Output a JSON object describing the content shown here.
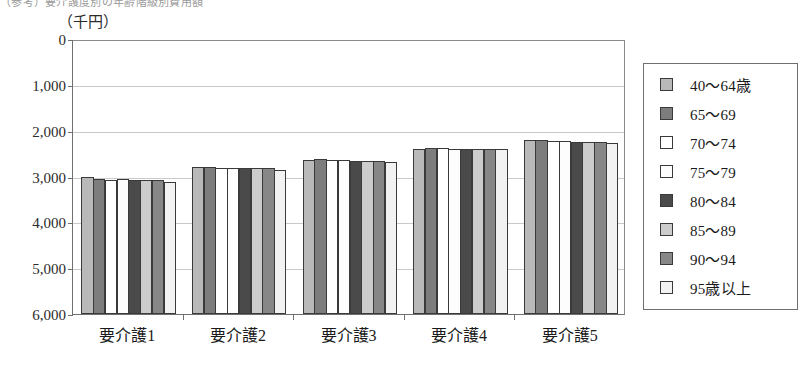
{
  "page": {
    "cut_title": "（参考）要介護度別の年齢階級別費用額"
  },
  "chart": {
    "unit_label": "（千円）",
    "y_ticks": [
      "6,000",
      "5,000",
      "4,000",
      "3,000",
      "2,000",
      "1,000",
      "0"
    ],
    "x_labels": [
      "要介護1",
      "要介護2",
      "要介護3",
      "要介護4",
      "要介護5"
    ],
    "legend_title": ""
  },
  "legend": {
    "items": [
      {
        "label": "40〜64歳",
        "swatch": "legend-swatch-0",
        "color": "#b9b9b9"
      },
      {
        "label": "65〜69",
        "swatch": "legend-swatch-1",
        "color": "#7d7d7d"
      },
      {
        "label": "70〜74",
        "swatch": "legend-swatch-2",
        "color": "#ffffff"
      },
      {
        "label": "75〜79",
        "swatch": "legend-swatch-3",
        "color": "#fdfdfd"
      },
      {
        "label": "80〜84",
        "swatch": "legend-swatch-4",
        "color": "#4a4a4a"
      },
      {
        "label": "85〜89",
        "swatch": "legend-swatch-5",
        "color": "#cccccc"
      },
      {
        "label": "90〜94",
        "swatch": "legend-swatch-6",
        "color": "#878787"
      },
      {
        "label": "95歳以上",
        "swatch": "legend-swatch-7",
        "color": "#f2f2f2"
      }
    ]
  },
  "chart_data": {
    "type": "bar",
    "title": "",
    "xlabel": "",
    "ylabel": "（千円）",
    "ylim": [
      0,
      6000
    ],
    "ytick_values": [
      0,
      1000,
      2000,
      3000,
      4000,
      5000,
      6000
    ],
    "grid": true,
    "legend_position": "right",
    "categories": [
      "要介護1",
      "要介護2",
      "要介護3",
      "要介護4",
      "要介護5"
    ],
    "series": [
      {
        "name": "40〜64歳",
        "values": [
          2980,
          3200,
          3370,
          3590,
          3790
        ]
      },
      {
        "name": "65〜69",
        "values": [
          2950,
          3210,
          3380,
          3630,
          3800
        ]
      },
      {
        "name": "70〜74",
        "values": [
          2930,
          3190,
          3360,
          3620,
          3780
        ]
      },
      {
        "name": "75〜79",
        "values": [
          2940,
          3180,
          3350,
          3610,
          3770
        ]
      },
      {
        "name": "80〜84",
        "values": [
          2930,
          3180,
          3340,
          3600,
          3760
        ]
      },
      {
        "name": "85〜89",
        "values": [
          2930,
          3180,
          3340,
          3600,
          3760
        ]
      },
      {
        "name": "90〜94",
        "values": [
          2920,
          3180,
          3340,
          3600,
          3760
        ]
      },
      {
        "name": "95歳以上",
        "values": [
          2890,
          3150,
          3320,
          3590,
          3740
        ]
      }
    ]
  }
}
